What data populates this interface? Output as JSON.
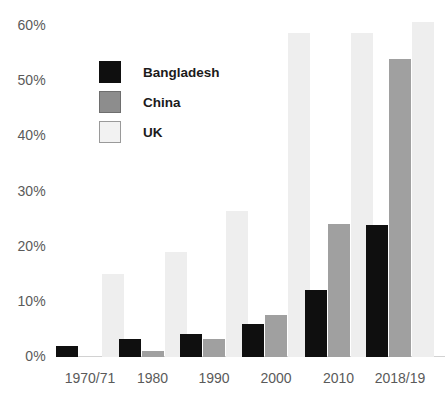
{
  "chart_data": {
    "type": "bar",
    "title": "",
    "xlabel": "",
    "ylabel": "",
    "categories": [
      "1970/71",
      "1980",
      "1990",
      "2000",
      "2010",
      "2018/19"
    ],
    "series": [
      {
        "name": "Bangladesh",
        "color": "#0f0f0f",
        "values": [
          2.0,
          3.3,
          4.2,
          6.0,
          12.1,
          24.0
        ]
      },
      {
        "name": "China",
        "color": "#a0a0a0",
        "values": [
          0.0,
          1.0,
          3.2,
          7.6,
          24.1,
          54.0
        ]
      },
      {
        "name": "UK",
        "color": "#eeeeee",
        "values": [
          15.0,
          19.0,
          26.5,
          58.7,
          58.7,
          60.7
        ]
      }
    ],
    "ylim": [
      0,
      60
    ],
    "y_ticks": [
      0,
      10,
      20,
      30,
      40,
      50,
      60
    ],
    "y_tick_labels": [
      "0%",
      "10%",
      "20%",
      "30%",
      "40%",
      "50%",
      "60%"
    ],
    "grid": false,
    "legend_position": "upper-left"
  }
}
